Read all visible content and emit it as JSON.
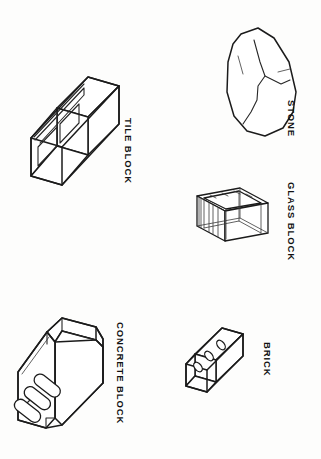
{
  "figure": {
    "style": "black line drawing on white background",
    "background_color": "#fdfdfc",
    "line_color": "#1b1b1b",
    "label_orientation": "rotated 90 degrees clockwise",
    "items": [
      {
        "id": "tile-block",
        "label": "TILE BLOCK",
        "description": "hollow clay tile block in isometric view with two rectangular cells",
        "position": "top-left",
        "cells": 2
      },
      {
        "id": "stone",
        "label": "STONE",
        "description": "irregular rough-faced natural stone with surface fracture lines",
        "position": "top-right",
        "cells": 0
      },
      {
        "id": "glass-block",
        "label": "GLASS BLOCK",
        "description": "transparent hollow glass block drawn as a wireframe with visible hidden edges",
        "position": "middle-right",
        "cells": 0
      },
      {
        "id": "concrete-block",
        "label": "CONCRETE BLOCK",
        "description": "concrete masonry unit in isometric view with three oval cores and notched ends",
        "position": "bottom-left",
        "cells": 3
      },
      {
        "id": "brick",
        "label": "BRICK",
        "description": "solid clay brick in isometric view with three small oval core holes on the top face",
        "position": "bottom-right",
        "cells": 3
      }
    ]
  }
}
